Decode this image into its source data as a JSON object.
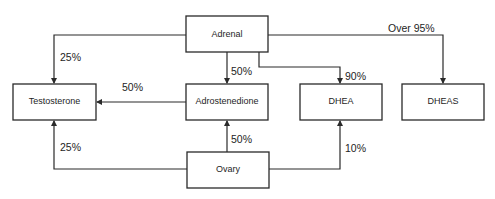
{
  "diagram": {
    "type": "flowchart",
    "nodes": [
      {
        "id": "adrenal",
        "label": "Adrenal"
      },
      {
        "id": "testosterone",
        "label": "Testosterone"
      },
      {
        "id": "adrostenedione",
        "label": "Adrostenedione"
      },
      {
        "id": "dhea",
        "label": "DHEA"
      },
      {
        "id": "dheas",
        "label": "DHEAS"
      },
      {
        "id": "ovary",
        "label": "Ovary"
      }
    ],
    "edges": [
      {
        "from": "adrenal",
        "to": "testosterone",
        "label": "25%"
      },
      {
        "from": "adrenal",
        "to": "adrostenedione",
        "label": "50%"
      },
      {
        "from": "adrenal",
        "to": "dhea",
        "label": "90%"
      },
      {
        "from": "adrenal",
        "to": "dheas",
        "label": "Over 95%"
      },
      {
        "from": "adrostenedione",
        "to": "testosterone",
        "label": "50%"
      },
      {
        "from": "ovary",
        "to": "adrostenedione",
        "label": "50%"
      },
      {
        "from": "ovary",
        "to": "testosterone",
        "label": "25%"
      },
      {
        "from": "ovary",
        "to": "dhea",
        "label": "10%"
      }
    ]
  },
  "colors": {
    "line": "#2a2a2a",
    "text": "#1e1e1e",
    "background": "#ffffff"
  }
}
